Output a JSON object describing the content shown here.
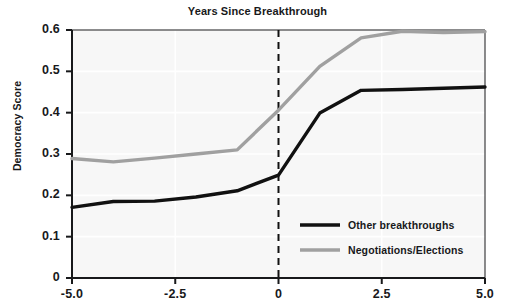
{
  "chart_data": {
    "type": "line",
    "title": "Years Since Breakthrough",
    "xlabel": "",
    "ylabel": "Democracy Score",
    "xlim": [
      -5.0,
      5.0
    ],
    "ylim": [
      0,
      0.6
    ],
    "grid": true,
    "legend_position": "lower right",
    "xticks": [
      "-5.0",
      "-2.5",
      "0",
      "2.5",
      "5.0"
    ],
    "xtick_values": [
      -5.0,
      -2.5,
      0,
      2.5,
      5.0
    ],
    "yticks": [
      "0",
      "0.1",
      "0.2",
      "0.3",
      "0.4",
      "0.5",
      "0.6"
    ],
    "ytick_values": [
      0,
      0.1,
      0.2,
      0.3,
      0.4,
      0.5,
      0.6
    ],
    "annotations": [
      {
        "type": "vline",
        "x": 0,
        "style": "dashed",
        "color": "#111111"
      }
    ],
    "x": [
      -5,
      -4,
      -3,
      -2,
      -1,
      0,
      1,
      2,
      3,
      4,
      5
    ],
    "series": [
      {
        "name": "Other breakthroughs",
        "color": "#111111",
        "values": [
          0.171,
          0.185,
          0.186,
          0.196,
          0.211,
          0.249,
          0.399,
          0.454,
          0.456,
          0.459,
          0.462
        ]
      },
      {
        "name": "Negotiations/Elections",
        "color": "#a0a0a0",
        "values": [
          0.289,
          0.281,
          0.29,
          0.3,
          0.31,
          0.406,
          0.512,
          0.581,
          0.597,
          0.594,
          0.596
        ]
      }
    ]
  },
  "axes": {
    "title": "Years Since Breakthrough",
    "ylabel": "Democracy Score"
  },
  "legend": {
    "entries": [
      {
        "label": "Other breakthroughs",
        "color": "#111111"
      },
      {
        "label": "Negotiations/Elections",
        "color": "#a0a0a0"
      }
    ]
  }
}
